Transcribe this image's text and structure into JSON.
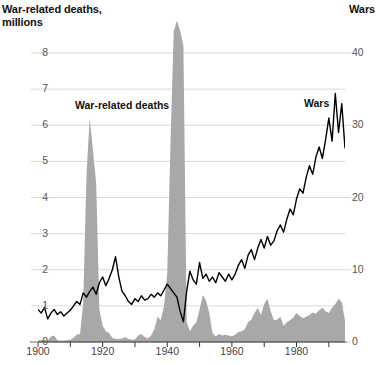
{
  "chart": {
    "left_axis_title": "War-related deaths,\nmillions",
    "right_axis_title": "Wars",
    "series_label_deaths": "War-related deaths",
    "series_label_wars": "Wars",
    "colors": {
      "area_fill": "#a8a8a8",
      "line": "#000000",
      "gridline": "#d9d9d9",
      "axis": "#333333",
      "tick_text": "#555555"
    }
  },
  "chart_data": {
    "type": "area",
    "title": "",
    "subtitle": "",
    "xlabel": "",
    "ylabel": "War-related deaths, millions",
    "y2label": "Wars",
    "xlim": [
      1900,
      1995
    ],
    "ylim": [
      0,
      8
    ],
    "y2lim": [
      0,
      40
    ],
    "grid": true,
    "legend": "inline-annotations",
    "x_ticks": [
      1900,
      1920,
      1940,
      1960,
      1980
    ],
    "x_minor_ticks": [
      1910,
      1930,
      1950,
      1970,
      1990
    ],
    "y_ticks": [
      0,
      1,
      2,
      3,
      4,
      5,
      6,
      7,
      8
    ],
    "y2_ticks": [
      0,
      10,
      20,
      30,
      40
    ],
    "x": [
      1900,
      1901,
      1902,
      1903,
      1904,
      1905,
      1906,
      1907,
      1908,
      1909,
      1910,
      1911,
      1912,
      1913,
      1914,
      1915,
      1916,
      1917,
      1918,
      1919,
      1920,
      1921,
      1922,
      1923,
      1924,
      1925,
      1926,
      1927,
      1928,
      1929,
      1930,
      1931,
      1932,
      1933,
      1934,
      1935,
      1936,
      1937,
      1938,
      1939,
      1940,
      1941,
      1942,
      1943,
      1944,
      1945,
      1946,
      1947,
      1948,
      1949,
      1950,
      1951,
      1952,
      1953,
      1954,
      1955,
      1956,
      1957,
      1958,
      1959,
      1960,
      1961,
      1962,
      1963,
      1964,
      1965,
      1966,
      1967,
      1968,
      1969,
      1970,
      1971,
      1972,
      1973,
      1974,
      1975,
      1976,
      1977,
      1978,
      1979,
      1980,
      1981,
      1982,
      1983,
      1984,
      1985,
      1986,
      1987,
      1988,
      1989,
      1990,
      1991,
      1992,
      1993,
      1994,
      1995
    ],
    "series": [
      {
        "name": "War-related deaths",
        "units": "millions",
        "axis": "left",
        "render": "area",
        "color": "#a8a8a8",
        "note": "WWII peak is clipped above the top of the plot area",
        "values": [
          0.05,
          0.05,
          0.06,
          0.04,
          0.15,
          0.18,
          0.05,
          0.04,
          0.04,
          0.05,
          0.06,
          0.12,
          0.2,
          0.22,
          1.1,
          4.6,
          6.2,
          5.3,
          4.4,
          0.9,
          0.45,
          0.3,
          0.25,
          0.12,
          0.08,
          0.08,
          0.1,
          0.14,
          0.08,
          0.06,
          0.07,
          0.18,
          0.22,
          0.14,
          0.1,
          0.18,
          0.35,
          0.7,
          0.6,
          1.0,
          1.9,
          5.5,
          8.6,
          8.9,
          8.6,
          8.2,
          0.55,
          0.3,
          0.45,
          0.55,
          0.9,
          1.3,
          1.15,
          0.8,
          0.25,
          0.15,
          0.22,
          0.18,
          0.2,
          0.18,
          0.16,
          0.2,
          0.28,
          0.3,
          0.35,
          0.55,
          0.62,
          0.8,
          0.95,
          0.75,
          1.05,
          1.2,
          0.85,
          0.6,
          0.62,
          0.7,
          0.45,
          0.55,
          0.6,
          0.68,
          0.8,
          0.72,
          0.66,
          0.7,
          0.75,
          0.82,
          0.78,
          0.88,
          0.95,
          0.85,
          0.8,
          0.95,
          1.05,
          1.2,
          1.1,
          0.6
        ]
      },
      {
        "name": "Wars",
        "units": "count",
        "axis": "right",
        "render": "line",
        "color": "#000000",
        "values": [
          4.5,
          4.0,
          4.8,
          3.2,
          4.0,
          4.5,
          3.8,
          4.2,
          3.6,
          4.0,
          4.4,
          5.0,
          5.6,
          5.2,
          6.8,
          6.2,
          7.0,
          7.6,
          6.6,
          8.2,
          9.0,
          7.8,
          8.8,
          10.0,
          11.8,
          9.0,
          7.0,
          6.4,
          5.6,
          5.2,
          6.0,
          5.6,
          6.4,
          5.8,
          6.0,
          6.6,
          6.2,
          6.8,
          6.4,
          7.2,
          8.0,
          7.4,
          6.8,
          6.2,
          4.2,
          2.8,
          7.0,
          9.8,
          8.6,
          8.0,
          11.0,
          8.8,
          9.4,
          8.4,
          9.0,
          8.2,
          9.6,
          9.0,
          8.4,
          9.4,
          8.6,
          9.4,
          10.6,
          11.4,
          10.2,
          12.0,
          12.8,
          11.4,
          13.0,
          14.2,
          13.0,
          14.6,
          13.4,
          14.0,
          15.4,
          16.2,
          15.2,
          17.0,
          18.4,
          17.6,
          19.8,
          21.2,
          20.6,
          22.8,
          24.4,
          23.2,
          25.6,
          27.0,
          25.4,
          28.0,
          31.0,
          27.8,
          34.4,
          29.0,
          33.0,
          26.8
        ]
      }
    ]
  }
}
